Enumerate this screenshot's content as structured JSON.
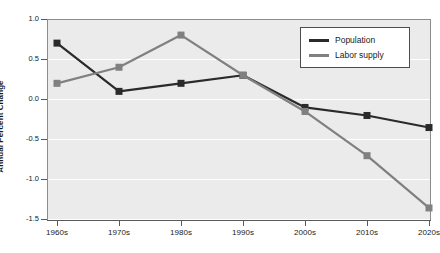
{
  "chart_data": {
    "type": "line",
    "title": "",
    "xlabel": "",
    "ylabel": "Annual Percent Change",
    "categories": [
      "1960s",
      "1970s",
      "1980s",
      "1990s",
      "2000s",
      "2010s",
      "2020s"
    ],
    "ylim": [
      -1.5,
      1.0
    ],
    "xlim": [
      0,
      6
    ],
    "yticks": [
      "1.0",
      "0.5",
      "0.0",
      "-0.5",
      "-1.0",
      "-1.5"
    ],
    "ytick_values": [
      1.0,
      0.5,
      0.0,
      -0.5,
      -1.0,
      -1.5
    ],
    "grid": true,
    "grid_axis": "y",
    "legend_position": "top-right",
    "plot_background": "#ebebeb",
    "gridline_color": "#ffffff",
    "series": [
      {
        "name": "Population",
        "color": "#2a2a2a",
        "marker": "square",
        "values": [
          0.7,
          0.1,
          0.2,
          0.3,
          -0.1,
          -0.2,
          -0.35
        ]
      },
      {
        "name": "Labor supply",
        "color": "#808080",
        "marker": "square",
        "values": [
          0.2,
          0.4,
          0.8,
          0.3,
          -0.15,
          -0.7,
          -1.35
        ]
      }
    ]
  },
  "axis": {
    "y_title": "Annual Percent Change",
    "y_tick_labels": [
      "1.0",
      "0.5",
      "0.0",
      "-0.5",
      "-1.0",
      "-1.5"
    ],
    "x_tick_labels": [
      "1960s",
      "1970s",
      "1980s",
      "1990s",
      "2000s",
      "2010s",
      "2020s"
    ]
  },
  "legend": {
    "entries": [
      {
        "label": "Population",
        "color": "#2a2a2a"
      },
      {
        "label": "Labor supply",
        "color": "#808080"
      }
    ]
  }
}
